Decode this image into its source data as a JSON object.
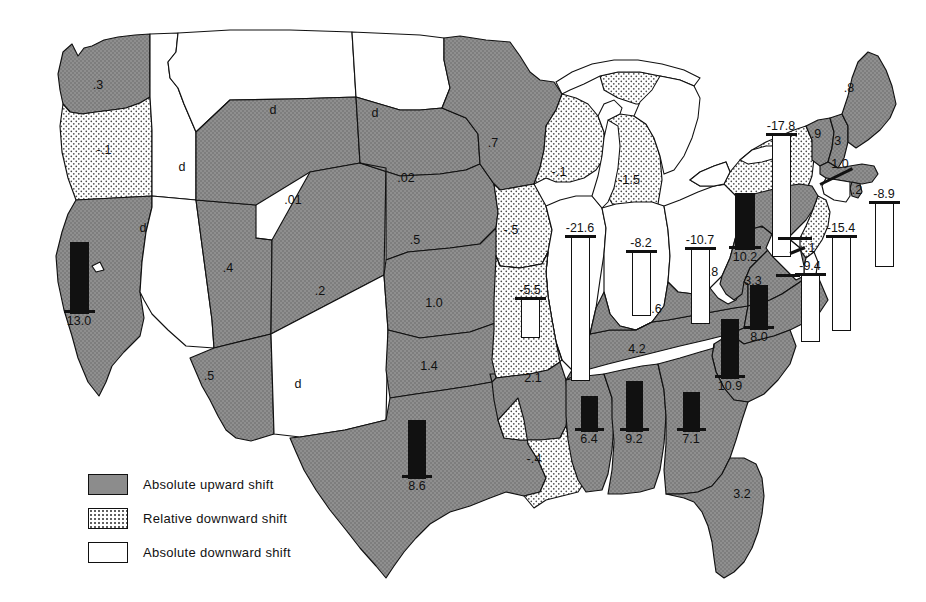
{
  "legend": {
    "items": [
      {
        "key": "up",
        "label": "Absolute upward shift"
      },
      {
        "key": "rel",
        "label": "Relative downward shift"
      },
      {
        "key": "down",
        "label": "Absolute downward shift"
      }
    ]
  },
  "colors": {
    "upward": "#8c8c8c",
    "relative_downward": "#ffffff",
    "absolute_downward": "#ffffff",
    "outline": "#111111",
    "bar_positive": "#111111",
    "bar_negative": "#ffffff",
    "background": "#ffffff"
  },
  "chart_data": {
    "type": "map",
    "value_note": "d = absolute downward shift without numeric value",
    "categories": [
      "WA",
      "OR",
      "ID",
      "MT",
      "ND",
      "MN",
      "WI",
      "MI",
      "NY",
      "ME",
      "VT",
      "NH",
      "MA",
      "RI",
      "CT",
      "SD",
      "WY",
      "NE",
      "IA",
      "IL",
      "IN",
      "OH",
      "PA",
      "NJ",
      "DE",
      "MD",
      "WV",
      "VA",
      "NC",
      "SC",
      "GA",
      "FL",
      "AL",
      "MS",
      "TN",
      "KY",
      "MO",
      "AR",
      "LA",
      "TX",
      "OK",
      "KS",
      "CO",
      "NM",
      "AZ",
      "UT",
      "NV",
      "CA"
    ],
    "values": [
      0.3,
      -0.1,
      null,
      null,
      null,
      0.7,
      -0.1,
      -1.5,
      -17.8,
      0.8,
      0.9,
      0.3,
      1.0,
      0.2,
      -8.9,
      0.02,
      0.01,
      0.5,
      -0.5,
      -21.6,
      -8.2,
      -10.7,
      10.2,
      -15.4,
      -0.1,
      -9.4,
      0.8,
      3.3,
      8.0,
      10.9,
      7.1,
      3.2,
      9.2,
      6.4,
      4.2,
      4.6,
      -5.5,
      2.1,
      -0.4,
      8.6,
      1.4,
      1.0,
      0.2,
      null,
      0.5,
      0.4,
      null,
      13.0
    ],
    "shift_classes": [
      "up",
      "rel",
      "down",
      "down",
      "down",
      "up",
      "rel",
      "rel",
      "rel",
      "up",
      "up",
      "up",
      "up",
      "up",
      "down",
      "up",
      "up",
      "up",
      "rel",
      "down",
      "down",
      "down",
      "up",
      "down",
      "down",
      "down",
      "up",
      "up",
      "up",
      "up",
      "up",
      "up",
      "up",
      "up",
      "up",
      "up",
      "rel",
      "up",
      "rel",
      "up",
      "up",
      "up",
      "up",
      "down",
      "up",
      "up",
      "down",
      "up"
    ]
  },
  "states": [
    {
      "id": "WA",
      "label": ".3",
      "shift": "up",
      "lx": 98,
      "ly": 85
    },
    {
      "id": "OR",
      "label": "-.1",
      "shift": "rel",
      "lx": 104,
      "ly": 150
    },
    {
      "id": "ID",
      "label": "d",
      "shift": "down",
      "lx": 182,
      "ly": 167
    },
    {
      "id": "MT",
      "label": "d",
      "shift": "down",
      "lx": 273,
      "ly": 110
    },
    {
      "id": "ND",
      "label": "d",
      "shift": "down",
      "lx": 375,
      "ly": 113
    },
    {
      "id": "SD",
      "label": ".02",
      "shift": "up",
      "lx": 406,
      "ly": 178
    },
    {
      "id": "MN",
      "label": ".7",
      "shift": "up",
      "lx": 493,
      "ly": 143
    },
    {
      "id": "WI",
      "label": "-.1",
      "shift": "rel",
      "lx": 559,
      "ly": 172
    },
    {
      "id": "MI",
      "label": "-1.5",
      "shift": "rel",
      "lx": 629,
      "ly": 180
    },
    {
      "id": "ME",
      "label": ".8",
      "shift": "up",
      "lx": 849,
      "ly": 88
    },
    {
      "id": "VT",
      "label": ".9",
      "shift": "up",
      "lx": 816,
      "ly": 134
    },
    {
      "id": "NH",
      "label": ".3",
      "shift": "up",
      "lx": 836,
      "ly": 141
    },
    {
      "id": "MA",
      "label": "1.0",
      "shift": "up",
      "lx": 840,
      "ly": 164
    },
    {
      "id": "WY",
      "label": ".01",
      "shift": "up",
      "lx": 293,
      "ly": 200
    },
    {
      "id": "NE",
      "label": ".5",
      "shift": "up",
      "lx": 415,
      "ly": 240
    },
    {
      "id": "IA",
      "label": "-.5",
      "shift": "rel",
      "lx": 511,
      "ly": 230
    },
    {
      "id": "UT",
      "label": ".4",
      "shift": "up",
      "lx": 228,
      "ly": 268
    },
    {
      "id": "CO",
      "label": ".2",
      "shift": "up",
      "lx": 320,
      "ly": 291
    },
    {
      "id": "KS",
      "label": "1.0",
      "shift": "up",
      "lx": 434,
      "ly": 303
    },
    {
      "id": "WV",
      "label": ".8",
      "shift": "up",
      "lx": 713,
      "ly": 272
    },
    {
      "id": "VA",
      "label": "3.3",
      "shift": "up",
      "lx": 753,
      "ly": 281
    },
    {
      "id": "KY",
      "label": "4.6",
      "shift": "up",
      "lx": 653,
      "ly": 309
    },
    {
      "id": "TN",
      "label": "4.2",
      "shift": "up",
      "lx": 637,
      "ly": 349
    },
    {
      "id": "AR",
      "label": "2.1",
      "shift": "up",
      "lx": 533,
      "ly": 378
    },
    {
      "id": "OK",
      "label": "1.4",
      "shift": "up",
      "lx": 429,
      "ly": 366
    },
    {
      "id": "AZ",
      "label": ".5",
      "shift": "up",
      "lx": 209,
      "ly": 376
    },
    {
      "id": "NM",
      "label": "d",
      "shift": "down",
      "lx": 298,
      "ly": 384
    },
    {
      "id": "NV",
      "label": "d",
      "shift": "down",
      "lx": 143,
      "ly": 228
    },
    {
      "id": "LA",
      "label": "-.4",
      "shift": "rel",
      "lx": 534,
      "ly": 459
    },
    {
      "id": "FL",
      "label": "3.2",
      "shift": "up",
      "lx": 742,
      "ly": 494
    },
    {
      "id": "DE",
      "label": "-.1",
      "shift": "down",
      "lx": 808,
      "ly": 248
    },
    {
      "id": "RI",
      "label": ".2",
      "shift": "up",
      "lx": 857,
      "ly": 190
    }
  ],
  "bars": [
    {
      "id": "CA",
      "value": "13.0",
      "dir": "pos",
      "x": 79,
      "base": 312,
      "h": 70,
      "w": 17
    },
    {
      "id": "TX",
      "value": "8.6",
      "dir": "pos",
      "x": 417,
      "base": 477,
      "h": 57,
      "w": 16
    },
    {
      "id": "MS",
      "value": "6.4",
      "dir": "pos",
      "x": 589,
      "base": 430,
      "h": 34,
      "w": 15
    },
    {
      "id": "AL",
      "value": "9.2",
      "dir": "pos",
      "x": 634,
      "base": 430,
      "h": 49,
      "w": 15
    },
    {
      "id": "GA",
      "value": "7.1",
      "dir": "pos",
      "x": 691,
      "base": 430,
      "h": 38,
      "w": 15
    },
    {
      "id": "SC",
      "value": "10.9",
      "dir": "pos",
      "x": 730,
      "base": 377,
      "h": 58,
      "w": 16
    },
    {
      "id": "NC",
      "value": "8.0",
      "dir": "pos",
      "x": 759,
      "base": 328,
      "h": 43,
      "w": 16
    },
    {
      "id": "PA",
      "value": "10.2",
      "dir": "pos",
      "x": 745,
      "base": 248,
      "h": 55,
      "w": 18
    },
    {
      "id": "NY",
      "value": "-17.8",
      "dir": "neg",
      "x": 781,
      "base": 135,
      "h": 120,
      "w": 17
    },
    {
      "id": "IL",
      "value": "-21.6",
      "dir": "neg",
      "x": 580,
      "base": 237,
      "h": 142,
      "w": 17
    },
    {
      "id": "IN",
      "value": "-8.2",
      "dir": "neg",
      "x": 641,
      "base": 252,
      "h": 62,
      "w": 17
    },
    {
      "id": "OH",
      "value": "-10.7",
      "dir": "neg",
      "x": 700,
      "base": 249,
      "h": 73,
      "w": 17
    },
    {
      "id": "MO",
      "value": "-5.5",
      "dir": "neg",
      "x": 530,
      "base": 299,
      "h": 37,
      "w": 17
    },
    {
      "id": "CT",
      "value": "-8.9",
      "dir": "neg",
      "x": 884,
      "base": 203,
      "h": 62,
      "w": 17
    },
    {
      "id": "NJ",
      "value": "-15.4",
      "dir": "neg",
      "x": 841,
      "base": 237,
      "h": 92,
      "w": 17
    },
    {
      "id": "MD",
      "value": "-9.4",
      "dir": "neg",
      "x": 810,
      "base": 275,
      "h": 65,
      "w": 17
    }
  ]
}
